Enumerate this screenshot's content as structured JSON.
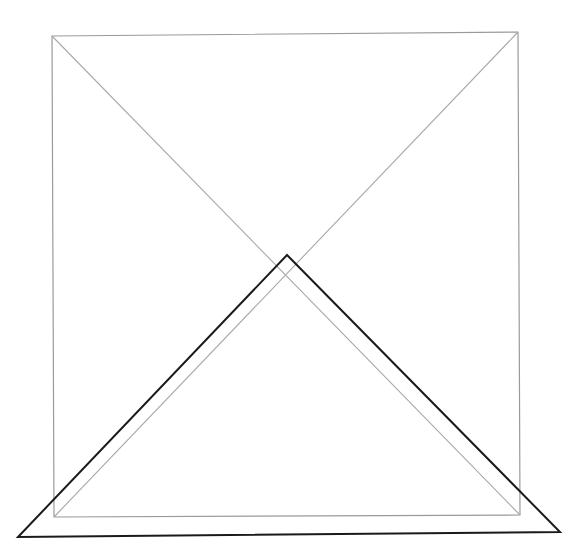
{
  "figure": {
    "background": "#ffffff",
    "square": {
      "stroke": "#9a9a9a",
      "stroke_width": 1.2,
      "corners": {
        "top_left": [
          52,
          36
        ],
        "top_right": [
          518,
          32
        ],
        "bottom_right": [
          520,
          515
        ],
        "bottom_left": [
          54,
          517
        ]
      }
    },
    "diagonals": {
      "stroke": "#a8a8a8",
      "stroke_width": 1.1,
      "lines": [
        {
          "from": [
            52,
            36
          ],
          "to": [
            520,
            515
          ]
        },
        {
          "from": [
            518,
            32
          ],
          "to": [
            54,
            517
          ]
        }
      ]
    },
    "triangle": {
      "stroke": "#1a1a1a",
      "stroke_width": 2,
      "points": {
        "apex": [
          287,
          255
        ],
        "bottom_left": [
          18,
          537
        ],
        "bottom_right": [
          560,
          532
        ]
      }
    }
  }
}
